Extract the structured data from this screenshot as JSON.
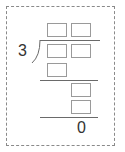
{
  "problem": {
    "type": "long-division",
    "divisor": "3",
    "remainder": "0",
    "quotient_boxes": 2,
    "dividend_boxes": 2,
    "first_product_boxes": 1,
    "second_partial_boxes": 1,
    "second_product_boxes": 1,
    "colors": {
      "border": "#8a8a8a",
      "box": "#9a9a9a",
      "line": "#6a6a6a",
      "text": "#333333"
    }
  }
}
